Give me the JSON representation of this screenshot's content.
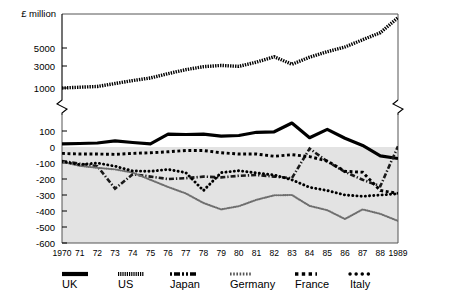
{
  "chart_data": {
    "type": "line",
    "title": "",
    "ylabel": "£ million",
    "xlabel": "",
    "grid": false,
    "legend_position": "bottom",
    "axis_break": true,
    "x": [
      1970,
      1971,
      1972,
      1973,
      1974,
      1975,
      1976,
      1977,
      1978,
      1979,
      1980,
      1981,
      1982,
      1983,
      1984,
      1985,
      1986,
      1987,
      1988,
      1989
    ],
    "tick_labels_x": [
      "1970",
      "71",
      "72",
      "73",
      "74",
      "75",
      "76",
      "77",
      "78",
      "79",
      "80",
      "81",
      "82",
      "83",
      "84",
      "85",
      "86",
      "87",
      "88",
      "1989"
    ],
    "upper_panel": {
      "ylim": [
        800,
        9500
      ],
      "ticks": [
        1000,
        3000,
        5000
      ],
      "tick_labels": [
        "1000",
        "3000",
        "5000"
      ],
      "scale": "log-like"
    },
    "lower_panel": {
      "ylim": [
        -600,
        160
      ],
      "ticks": [
        100,
        0,
        -100,
        -200,
        -300,
        -400,
        -500,
        -600
      ],
      "tick_labels": [
        "100",
        "0",
        "-100",
        "-200",
        "-300",
        "-400",
        "-500",
        "-600"
      ],
      "shaded_below_zero": true,
      "shade_color": "#e3e3e3"
    },
    "series": [
      {
        "name": "UK",
        "panel": "lower",
        "style": "solid-thick",
        "color": "#000000",
        "values": [
          20,
          22,
          25,
          38,
          28,
          20,
          80,
          78,
          80,
          68,
          72,
          92,
          95,
          150,
          58,
          110,
          55,
          10,
          -55,
          -72
        ]
      },
      {
        "name": "US",
        "panel": "upper",
        "style": "hatched-thick",
        "color": "#000000",
        "values": [
          1000,
          1040,
          1080,
          1250,
          1450,
          1650,
          2050,
          2500,
          2900,
          3050,
          2950,
          3350,
          3900,
          3150,
          3850,
          4500,
          5100,
          5900,
          6800,
          9200
        ]
      },
      {
        "name": "Japan",
        "panel": "lower",
        "style": "dash-dot",
        "color": "#1a1a1a",
        "values": [
          -88,
          -105,
          -120,
          -260,
          -170,
          -185,
          -200,
          -195,
          -185,
          -190,
          -180,
          -175,
          -185,
          -195,
          -10,
          -90,
          -155,
          -205,
          -245,
          5
        ]
      },
      {
        "name": "Germany",
        "panel": "lower",
        "style": "fine-dots",
        "color": "#6e6e6e",
        "values": [
          -92,
          -118,
          -130,
          -140,
          -160,
          -205,
          -250,
          -290,
          -350,
          -390,
          -370,
          -330,
          -302,
          -300,
          -368,
          -395,
          -450,
          -390,
          -418,
          -462
        ]
      },
      {
        "name": "France",
        "panel": "lower",
        "style": "square-dots",
        "color": "#000000",
        "values": [
          -40,
          -44,
          -44,
          -46,
          -40,
          -36,
          -30,
          -22,
          -22,
          -36,
          -44,
          -44,
          -58,
          -48,
          -60,
          -88,
          -152,
          -158,
          -272,
          -290
        ]
      },
      {
        "name": "Italy",
        "panel": "lower",
        "style": "round-dots",
        "color": "#000000",
        "values": [
          -90,
          -110,
          -100,
          -120,
          -150,
          -152,
          -140,
          -160,
          -272,
          -160,
          -148,
          -162,
          -175,
          -205,
          -252,
          -272,
          -300,
          -308,
          -300,
          -292
        ]
      }
    ]
  },
  "legend": {
    "items": [
      {
        "label": "UK",
        "marker": "solid-thick"
      },
      {
        "label": "US",
        "marker": "hatched-thick"
      },
      {
        "label": "Japan",
        "marker": "dash-dot"
      },
      {
        "label": "Germany",
        "marker": "fine-dots"
      },
      {
        "label": "France",
        "marker": "square-dots"
      },
      {
        "label": "Italy",
        "marker": "round-dots"
      }
    ]
  }
}
